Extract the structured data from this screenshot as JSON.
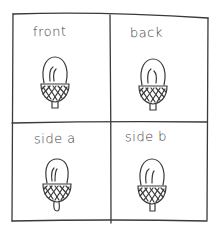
{
  "sketch": {
    "ink_color": "#3a3a3a",
    "background": "#ffffff",
    "panels": [
      {
        "label": "front"
      },
      {
        "label": "back"
      },
      {
        "label": "side a"
      },
      {
        "label": "side b"
      }
    ],
    "subject": "acorn-icon"
  }
}
